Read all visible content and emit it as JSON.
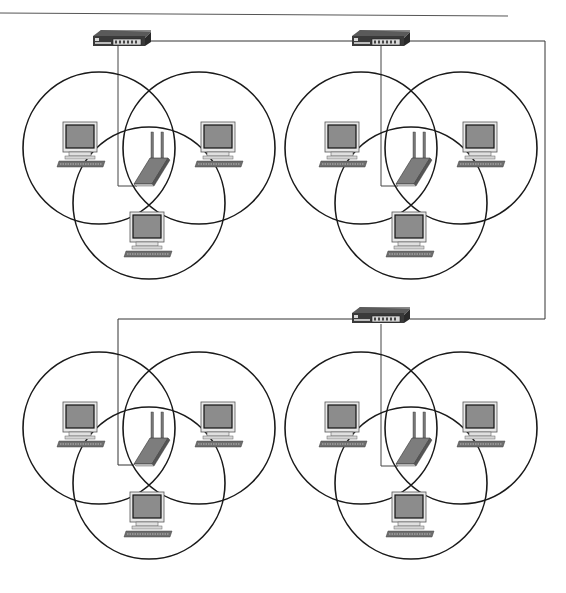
{
  "diagram": {
    "type": "network-topology",
    "colors": {
      "line": "#2a2a2a",
      "wire": "#555555",
      "circle": "#1a1a1a",
      "screen": "#8c8c8c",
      "device_body": "#3a3a3a",
      "device_light": "#d8d8d8",
      "ap_body": "#7d7d7d",
      "keyboard": "#6e6e6e",
      "monitor_frame": "#e4e4e4"
    },
    "switches": [
      {
        "id": "switch-1",
        "x": 93,
        "y": 30
      },
      {
        "id": "switch-2",
        "x": 352,
        "y": 30
      },
      {
        "id": "switch-3",
        "x": 352,
        "y": 307
      }
    ],
    "clusters": [
      {
        "id": "cell-top-left",
        "dx": 0,
        "dy": 0
      },
      {
        "id": "cell-top-right",
        "dx": 262,
        "dy": 0
      },
      {
        "id": "cell-bottom-left",
        "dx": 0,
        "dy": 262
      },
      {
        "id": "cell-bottom-right",
        "dx": 262,
        "dy": 262
      }
    ],
    "computers_per_cell": 3,
    "access_points_per_cell": 1
  }
}
